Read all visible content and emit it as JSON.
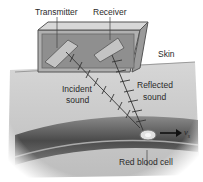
{
  "diagram": {
    "labels": {
      "transmitter": "Transmitter",
      "receiver": "Receiver",
      "skin": "Skin",
      "incident_line1": "Incident",
      "incident_line2": "sound",
      "reflected_line1": "Reflected",
      "reflected_line2": "sound",
      "red_blood_cell": "Red blood cell",
      "velocity": "v",
      "velocity_sub": "s"
    },
    "colors": {
      "skin_tissue": "#c8c8c8",
      "box_face": "#a8a8a8",
      "vessel_dark": "#5a5a5a",
      "text": "#2a2a2a"
    }
  }
}
